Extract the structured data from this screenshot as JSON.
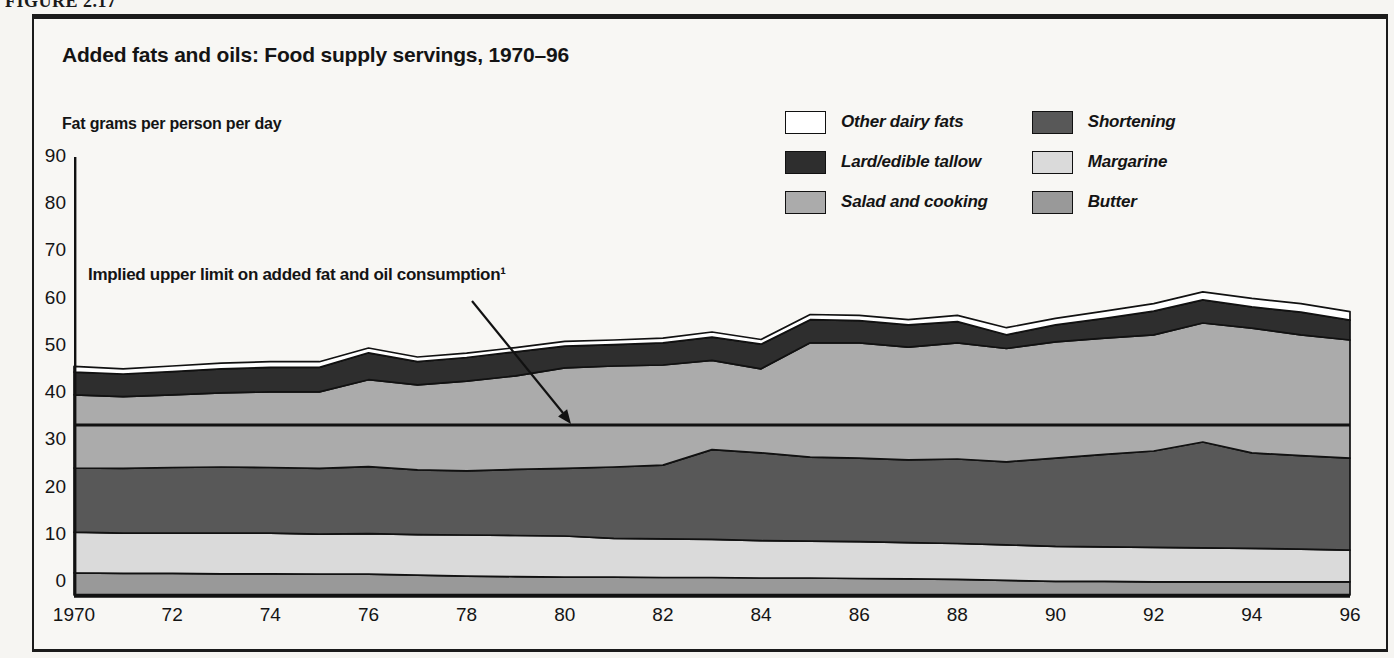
{
  "figure_label": "FIGURE 2.17",
  "title": "Added fats and oils: Food supply servings, 1970–96",
  "y_axis_label": "Fat grams per person per day",
  "annotation": {
    "text": "Implied upper limit on added fat and oil consumption¹",
    "value": 36
  },
  "colors": {
    "butter": "#999999",
    "margarine": "#dadada",
    "shortening": "#585858",
    "salad_cooking": "#ababab",
    "lard_tallow": "#2e2e2e",
    "other_dairy": "#ffffff",
    "line": "#111111",
    "paper": "#f8f7f4"
  },
  "legend": {
    "columns": [
      [
        {
          "series": "other_dairy",
          "label": "Other dairy fats"
        },
        {
          "series": "lard_tallow",
          "label": "Lard/edible tallow"
        },
        {
          "series": "salad_cooking",
          "label": "Salad and cooking"
        }
      ],
      [
        {
          "series": "shortening",
          "label": "Shortening"
        },
        {
          "series": "margarine",
          "label": "Margarine"
        },
        {
          "series": "butter",
          "label": "Butter"
        }
      ]
    ]
  },
  "chart_data": {
    "type": "area",
    "stacked": true,
    "xlabel": "Year",
    "ylabel": "Fat grams per person per day",
    "ylim": [
      0,
      90
    ],
    "grid": false,
    "legend_position": "top-right",
    "x": [
      1970,
      1971,
      1972,
      1973,
      1974,
      1975,
      1976,
      1977,
      1978,
      1979,
      1980,
      1981,
      1982,
      1983,
      1984,
      1985,
      1986,
      1987,
      1988,
      1989,
      1990,
      1991,
      1992,
      1993,
      1994,
      1995,
      1996
    ],
    "xticks": [
      "1970",
      "72",
      "74",
      "76",
      "78",
      "80",
      "82",
      "84",
      "86",
      "88",
      "90",
      "92",
      "94",
      "96"
    ],
    "yticks": [
      0,
      10,
      20,
      30,
      40,
      50,
      60,
      70,
      80,
      90
    ],
    "series": [
      {
        "key": "butter",
        "name": "Butter",
        "values": [
          4.7,
          4.6,
          4.6,
          4.5,
          4.5,
          4.4,
          4.4,
          4.2,
          4.0,
          3.9,
          3.8,
          3.8,
          3.7,
          3.7,
          3.6,
          3.6,
          3.5,
          3.4,
          3.3,
          3.1,
          2.9,
          2.9,
          2.8,
          2.8,
          2.8,
          2.8,
          2.8
        ]
      },
      {
        "key": "margarine",
        "name": "Margarine",
        "values": [
          8.6,
          8.5,
          8.5,
          8.6,
          8.6,
          8.5,
          8.6,
          8.6,
          8.7,
          8.7,
          8.7,
          8.2,
          8.2,
          8.1,
          7.9,
          7.8,
          7.8,
          7.7,
          7.6,
          7.5,
          7.4,
          7.3,
          7.3,
          7.2,
          7.1,
          6.9,
          6.7
        ]
      },
      {
        "key": "shortening",
        "name": "Shortening",
        "values": [
          13.6,
          13.7,
          13.9,
          14.0,
          13.9,
          13.9,
          14.2,
          13.7,
          13.6,
          14.0,
          14.3,
          15.1,
          15.6,
          19.0,
          18.6,
          17.8,
          17.7,
          17.5,
          17.9,
          17.6,
          18.7,
          19.6,
          20.4,
          22.4,
          20.2,
          19.8,
          19.5
        ]
      },
      {
        "key": "salad_cooking",
        "name": "Salad and cooking",
        "values": [
          15.5,
          15.2,
          15.4,
          15.7,
          16.0,
          16.2,
          18.4,
          18.0,
          19.0,
          19.8,
          21.3,
          21.4,
          21.2,
          18.9,
          17.8,
          24.2,
          24.4,
          23.9,
          24.6,
          24.0,
          24.6,
          24.6,
          24.6,
          25.2,
          26.4,
          25.6,
          25.0
        ]
      },
      {
        "key": "lard_tallow",
        "name": "Lard/edible tallow",
        "values": [
          4.8,
          4.8,
          4.9,
          5.1,
          5.2,
          5.2,
          5.7,
          4.9,
          5.0,
          5.1,
          4.6,
          4.5,
          4.7,
          4.9,
          5.2,
          4.9,
          4.7,
          4.7,
          4.5,
          2.9,
          3.6,
          4.2,
          5.0,
          4.9,
          4.5,
          4.8,
          4.2
        ]
      },
      {
        "key": "other_dairy",
        "name": "Other dairy fats",
        "values": [
          1.2,
          1.1,
          1.2,
          1.2,
          1.2,
          1.2,
          1.0,
          1.0,
          0.9,
          0.9,
          1.0,
          1.0,
          1.0,
          1.1,
          1.0,
          1.1,
          1.1,
          1.1,
          1.3,
          1.5,
          1.4,
          1.5,
          1.6,
          1.7,
          1.8,
          1.8,
          1.8
        ]
      }
    ],
    "reference_line": {
      "y": 36,
      "label": "Implied upper limit on added fat and oil consumption¹"
    }
  }
}
